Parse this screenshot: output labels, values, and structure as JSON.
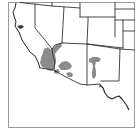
{
  "map": {
    "title": "",
    "region": "Southwestern United States",
    "states_shown": [
      "California",
      "Nevada",
      "Oregon",
      "Idaho",
      "Utah",
      "Wyoming",
      "Arizona",
      "Colorado",
      "New Mexico",
      "Nebraska",
      "Kansas",
      "Oklahoma",
      "Texas"
    ],
    "range_color": "#8c8c8c",
    "border_color": "#333333",
    "frame_color": "#9a9a9a",
    "background_color": "#ffffff",
    "range_areas": [
      {
        "name": "southern-california-nevada-arizona-range",
        "label": ""
      },
      {
        "name": "central-arizona-range",
        "label": ""
      },
      {
        "name": "southeast-arizona-range",
        "label": ""
      },
      {
        "name": "new-mexico-range",
        "label": ""
      }
    ]
  }
}
